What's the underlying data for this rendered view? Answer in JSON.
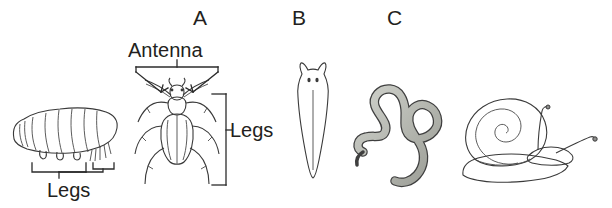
{
  "figure": {
    "background_color": "#ffffff",
    "ink_color": "#231f20",
    "specimen_fill_mid": "#9b9b9b",
    "specimen_fill_light": "#c9cbc6",
    "specimen_fill_dark": "#878787",
    "outline_color": "#3a3a3a"
  },
  "letters": [
    {
      "text": "A",
      "name": "letter-label-a"
    },
    {
      "text": "B",
      "name": "letter-label-b"
    },
    {
      "text": "C",
      "name": "letter-label-c"
    }
  ],
  "callouts": [
    {
      "text": "Legs",
      "name": "caterpillar-legs-label"
    },
    {
      "text": "Antenna",
      "name": "beetle-antenna-label"
    },
    {
      "text": "Legs",
      "name": "beetle-legs-label"
    }
  ],
  "specimens": [
    {
      "name": "caterpillar",
      "letter": "",
      "labels": [
        "Legs"
      ]
    },
    {
      "name": "beetle",
      "letter": "A",
      "labels": [
        "Antenna",
        "Legs"
      ]
    },
    {
      "name": "flatworm",
      "letter": "B",
      "labels": []
    },
    {
      "name": "roundworm",
      "letter": "C",
      "labels": []
    },
    {
      "name": "snail",
      "letter": "",
      "labels": []
    }
  ]
}
